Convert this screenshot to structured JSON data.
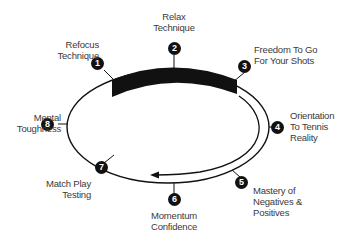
{
  "diagram": {
    "type": "cycle",
    "colors": {
      "stroke": "#111111",
      "text": "#3a3a3a",
      "badge_bg": "#111111",
      "badge_text": "#ffffff"
    },
    "steps": [
      {
        "number": "1",
        "lines": [
          "Refocus",
          "Technique"
        ]
      },
      {
        "number": "2",
        "lines": [
          "Relax",
          "Technique"
        ]
      },
      {
        "number": "3",
        "lines": [
          "Freedom To Go",
          "For Your Shots"
        ]
      },
      {
        "number": "4",
        "lines": [
          "Orientation",
          "To Tennis",
          "Reality"
        ]
      },
      {
        "number": "5",
        "lines": [
          "Mastery of",
          "Negatives &",
          "Positives"
        ]
      },
      {
        "number": "6",
        "lines": [
          "Momentum",
          "Confidence"
        ]
      },
      {
        "number": "7",
        "lines": [
          "Match Play",
          "Testing"
        ]
      },
      {
        "number": "8",
        "lines": [
          "Mental",
          "Toughness"
        ]
      }
    ]
  }
}
